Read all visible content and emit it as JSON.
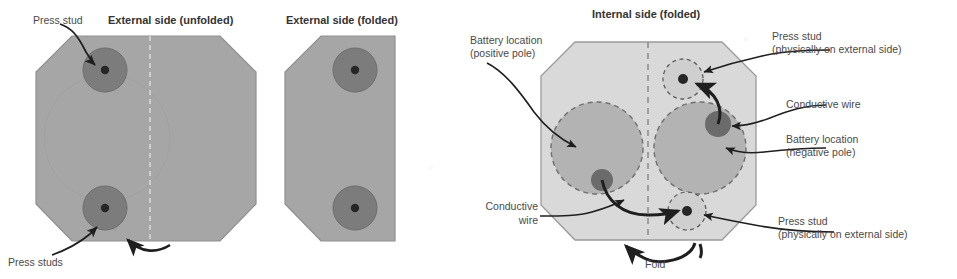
{
  "panels": {
    "external_unfolded": {
      "title": "External side (unfolded)"
    },
    "external_folded": {
      "title": "External side (folded)"
    },
    "internal_folded": {
      "title": "Internal side (folded)"
    }
  },
  "labels": {
    "press_stud_single": "Press stud",
    "press_studs_plural": "Press studs",
    "battery_positive_line1": "Battery location",
    "battery_positive_line2": "(positive pole)",
    "battery_negative_line1": "Battery location",
    "battery_negative_line2": "(negative pole)",
    "press_stud_ext_top_line1": "Press stud",
    "press_stud_ext_top_line2": "(physically on external side)",
    "press_stud_ext_bottom_line1": "Press stud",
    "press_stud_ext_bottom_line2": "(physically on external side)",
    "conductive_wire_right": "Conductive wire",
    "conductive_wire_left_line1": "Conductive",
    "conductive_wire_left_line2": "wire",
    "fold": "Fold"
  },
  "colors": {
    "external_body": "#a6a6a6",
    "external_body_stroke": "#8f8f8f",
    "internal_body": "#d9d9d9",
    "internal_body_stroke": "#9a9a9a",
    "battery_circle": "#b0b0b0",
    "battery_circle_stroke": "#6f6f6f",
    "press_stud_outer": "#7a7a7a",
    "press_stud_inner": "#2b2b2b",
    "wire": "#1f1f1f",
    "fold_line": "#8a8a8a",
    "text": "#4a4a4a",
    "background": "#ffffff"
  }
}
